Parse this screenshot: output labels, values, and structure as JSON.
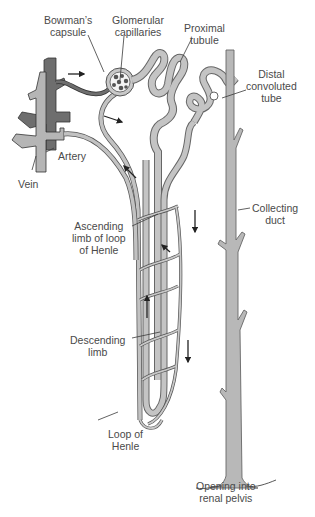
{
  "diagram": {
    "colors": {
      "tubule_fill": "#bdbdbd",
      "tubule_stroke": "#6a6a6a",
      "vein_fill": "#b5b5b5",
      "artery_fill": "#6e6e6e",
      "duct_fill": "#b8b8b8",
      "label_text": "#4a4a4a",
      "leader_line": "#3a3a3a",
      "background": "#ffffff"
    },
    "labels": [
      {
        "id": "bowmans-capsule",
        "lines": [
          "Bowman’s",
          "capsule"
        ]
      },
      {
        "id": "glomerular-capillaries",
        "lines": [
          "Glomerular",
          "capillaries"
        ]
      },
      {
        "id": "proximal-tubule",
        "lines": [
          "Proximal",
          "tubule"
        ]
      },
      {
        "id": "distal-convoluted-tube",
        "lines": [
          "Distal",
          "convoluted",
          "tube"
        ]
      },
      {
        "id": "artery",
        "lines": [
          "Artery"
        ]
      },
      {
        "id": "vein",
        "lines": [
          "Vein"
        ]
      },
      {
        "id": "collecting-duct",
        "lines": [
          "Collecting",
          "duct"
        ]
      },
      {
        "id": "ascending-limb",
        "lines": [
          "Ascending",
          "limb of loop",
          "of Henle"
        ]
      },
      {
        "id": "descending-limb",
        "lines": [
          "Descending",
          "limb"
        ]
      },
      {
        "id": "loop-of-henle",
        "lines": [
          "Loop of",
          "Henle"
        ]
      },
      {
        "id": "renal-pelvis-opening",
        "lines": [
          "Opening into",
          "renal pelvis"
        ]
      }
    ],
    "flow_arrows": [
      {
        "id": "afferent-flow",
        "direction": "right"
      },
      {
        "id": "efferent-flow",
        "direction": "down-right"
      },
      {
        "id": "ascending-flow-upper",
        "direction": "up-left"
      },
      {
        "id": "peritubular-flow-down-1",
        "direction": "down"
      },
      {
        "id": "peritubular-flow-diag",
        "direction": "up-left"
      },
      {
        "id": "peritubular-flow-up",
        "direction": "up"
      },
      {
        "id": "peritubular-flow-down-2",
        "direction": "down"
      }
    ]
  }
}
